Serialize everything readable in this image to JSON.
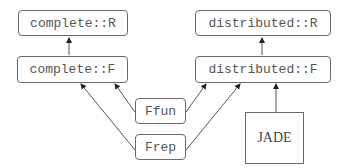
{
  "diagram": {
    "nodes": [
      {
        "id": "complete_R",
        "label": "complete::R"
      },
      {
        "id": "complete_F",
        "label": "complete::F"
      },
      {
        "id": "distributed_R",
        "label": "distributed::R"
      },
      {
        "id": "distributed_F",
        "label": "distributed::F"
      },
      {
        "id": "Ffun",
        "label": "Ffun"
      },
      {
        "id": "Frep",
        "label": "Frep"
      },
      {
        "id": "JADE",
        "label": "JADE"
      }
    ],
    "edges": [
      {
        "from": "complete_F",
        "to": "complete_R"
      },
      {
        "from": "distributed_F",
        "to": "distributed_R"
      },
      {
        "from": "Ffun",
        "to": "complete_F"
      },
      {
        "from": "Frep",
        "to": "complete_F"
      },
      {
        "from": "Ffun",
        "to": "distributed_F"
      },
      {
        "from": "Frep",
        "to": "distributed_F"
      },
      {
        "from": "JADE",
        "to": "distributed_F"
      }
    ]
  }
}
